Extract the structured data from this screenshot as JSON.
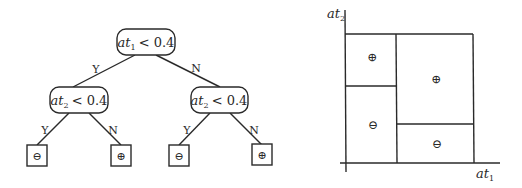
{
  "tree": {
    "root": {
      "attr": "at",
      "sub": "1",
      "op": "< 0.4"
    },
    "left": {
      "attr": "at",
      "sub": "2",
      "op": "< 0.4"
    },
    "right": {
      "attr": "at",
      "sub": "2",
      "op": "< 0.4"
    },
    "edge_labels": {
      "yes": "Y",
      "no": "N"
    },
    "leaves": [
      "⊖",
      "⊕",
      "⊖",
      "⊕"
    ]
  },
  "plot": {
    "y_axis_label": {
      "attr": "at",
      "sub": "2"
    },
    "x_axis_label": {
      "attr": "at",
      "sub": "1"
    },
    "regions": [
      {
        "name": "top-left",
        "symbol": "⊕"
      },
      {
        "name": "bottom-left",
        "symbol": "⊖"
      },
      {
        "name": "top-right",
        "symbol": "⊕"
      },
      {
        "name": "bottom-right",
        "symbol": "⊖"
      }
    ]
  }
}
